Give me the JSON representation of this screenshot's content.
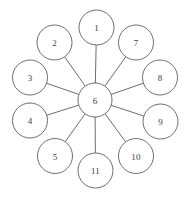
{
  "diagram": {
    "background_color": "#ffffff",
    "stroke_color": "#6e6e6e",
    "label_color": "#3a3a3a",
    "center_node_id": "6",
    "node_radius": 17.5,
    "center_radius": 17,
    "ring_radius": 71
  },
  "chart_data": {
    "type": "diagram",
    "layout": "star",
    "title": "",
    "nodes": [
      {
        "id": "n1",
        "label": "1",
        "cx": 96.5,
        "cy": 27.5,
        "r": 17.5,
        "role": "leaf"
      },
      {
        "id": "n2",
        "label": "2",
        "cx": 54.5,
        "cy": 42.5,
        "r": 17.5,
        "role": "leaf"
      },
      {
        "id": "n3",
        "label": "3",
        "cx": 30.0,
        "cy": 77.5,
        "r": 17.5,
        "role": "leaf"
      },
      {
        "id": "n4",
        "label": "4",
        "cx": 30.0,
        "cy": 120.5,
        "r": 17.5,
        "role": "leaf"
      },
      {
        "id": "n5",
        "label": "5",
        "cx": 55.0,
        "cy": 156.0,
        "r": 17.5,
        "role": "leaf"
      },
      {
        "id": "n6",
        "label": "6",
        "cx": 95.0,
        "cy": 100.0,
        "r": 17.0,
        "role": "hub"
      },
      {
        "id": "n7",
        "label": "7",
        "cx": 136.0,
        "cy": 42.5,
        "r": 17.5,
        "role": "leaf"
      },
      {
        "id": "n8",
        "label": "8",
        "cx": 160.0,
        "cy": 77.5,
        "r": 17.5,
        "role": "leaf"
      },
      {
        "id": "n9",
        "label": "9",
        "cx": 160.5,
        "cy": 121.5,
        "r": 17.5,
        "role": "leaf"
      },
      {
        "id": "n10",
        "label": "10",
        "cx": 136.0,
        "cy": 156.0,
        "r": 17.5,
        "role": "leaf"
      },
      {
        "id": "n11",
        "label": "11",
        "cx": 95.5,
        "cy": 170.5,
        "r": 17.5,
        "role": "leaf"
      }
    ],
    "edges": [
      {
        "from": "n6",
        "to": "n1"
      },
      {
        "from": "n6",
        "to": "n2"
      },
      {
        "from": "n6",
        "to": "n3"
      },
      {
        "from": "n6",
        "to": "n4"
      },
      {
        "from": "n6",
        "to": "n5"
      },
      {
        "from": "n6",
        "to": "n7"
      },
      {
        "from": "n6",
        "to": "n8"
      },
      {
        "from": "n6",
        "to": "n9"
      },
      {
        "from": "n6",
        "to": "n10"
      },
      {
        "from": "n6",
        "to": "n11"
      }
    ],
    "node_count": 11,
    "edge_count": 10
  }
}
